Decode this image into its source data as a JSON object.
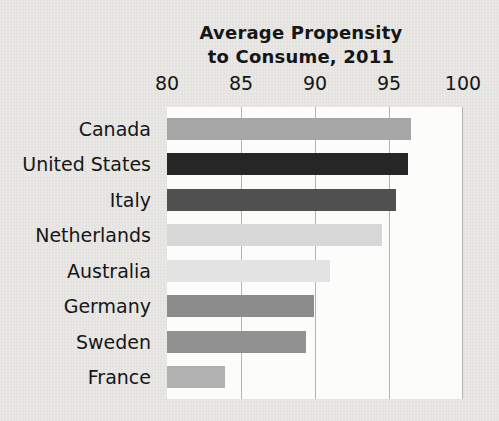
{
  "chart_data": {
    "type": "bar",
    "orientation": "horizontal",
    "title": "Average Propensity to Consume, 2011",
    "title_lines": [
      "Average Propensity",
      "to Consume, 2011"
    ],
    "categories": [
      "Canada",
      "United States",
      "Italy",
      "Netherlands",
      "Australia",
      "Germany",
      "Sweden",
      "France"
    ],
    "values": [
      96.5,
      96.3,
      95.5,
      94.5,
      91.0,
      89.9,
      89.4,
      83.9
    ],
    "bar_colors": [
      "#a6a6a6",
      "#262626",
      "#505050",
      "#d8d8d8",
      "#e3e3e3",
      "#8c8c8c",
      "#919191",
      "#b1b1b1"
    ],
    "xlabel": "",
    "ylabel": "",
    "xlim": [
      80,
      100
    ],
    "x_ticks": [
      "80",
      "85",
      "90",
      "95",
      "100"
    ],
    "x_tick_values": [
      80,
      85,
      90,
      95,
      100
    ],
    "gridlines_at": [
      85,
      90,
      95,
      100
    ],
    "axis_position": "top",
    "grid": true,
    "legend": "none"
  },
  "style": {
    "page_bg": "#e6e5e2",
    "plot_bg": "#fcfcfb",
    "gridline_color": "#b3b3b3",
    "text_color": "#161616"
  }
}
